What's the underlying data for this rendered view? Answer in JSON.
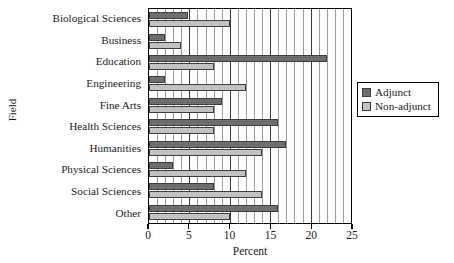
{
  "chart_data": {
    "type": "bar",
    "orientation": "horizontal",
    "title": "",
    "xlabel": "Percent",
    "ylabel": "Field",
    "xlim": [
      0,
      25
    ],
    "ylim": null,
    "grid": true,
    "grid_minor_step": 1,
    "grid_major_step": 5,
    "legend_position": "right",
    "xticks": [
      "0",
      "5",
      "10",
      "15",
      "20",
      "25"
    ],
    "xtick_values": [
      0,
      5,
      10,
      15,
      20,
      25
    ],
    "categories": [
      "Biological Sciences",
      "Business",
      "Education",
      "Engineering",
      "Fine Arts",
      "Health Sciences",
      "Humanities",
      "Physical Sciences",
      "Social Sciences",
      "Other"
    ],
    "series": [
      {
        "name": "Adjunct",
        "color": "#6e6e6e",
        "values": [
          4.8,
          2,
          22,
          2,
          9,
          16,
          17,
          3,
          8,
          16
        ]
      },
      {
        "name": "Non-adjunct",
        "color": "#c2c2c2",
        "values": [
          10,
          4,
          8,
          12,
          8,
          8,
          14,
          12,
          14,
          10
        ]
      }
    ]
  },
  "legend": {
    "entries": [
      {
        "label": "Adjunct",
        "swatch": "adjunct"
      },
      {
        "label": "Non-adjunct",
        "swatch": "nonadjunct"
      }
    ]
  }
}
